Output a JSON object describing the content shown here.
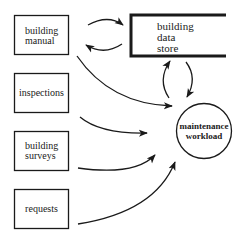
{
  "diagram": {
    "type": "flow diagram",
    "sources": [
      {
        "id": "building-manual",
        "lines": [
          "building",
          "manual"
        ]
      },
      {
        "id": "inspections",
        "lines": [
          "inspections"
        ]
      },
      {
        "id": "building-surveys",
        "lines": [
          "building",
          "surveys"
        ]
      },
      {
        "id": "requests",
        "lines": [
          "requests"
        ]
      }
    ],
    "data_store": {
      "lines": [
        "building",
        "data",
        "store"
      ]
    },
    "process": {
      "lines": [
        "maintenance",
        "workload"
      ]
    },
    "edges": [
      {
        "from": "building-manual",
        "to": "data_store"
      },
      {
        "from": "data_store",
        "to": "building-manual"
      },
      {
        "from": "building-manual",
        "to": "process"
      },
      {
        "from": "inspections",
        "to": "process"
      },
      {
        "from": "building-surveys",
        "to": "process"
      },
      {
        "from": "requests",
        "to": "process"
      },
      {
        "from": "process",
        "to": "data_store"
      },
      {
        "from": "data_store",
        "to": "process"
      }
    ],
    "colors": {
      "stroke": "#1a1a1a",
      "background": "#ffffff"
    }
  }
}
